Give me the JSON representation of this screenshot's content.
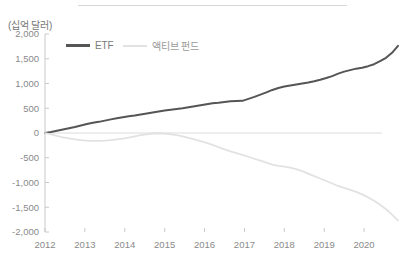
{
  "figure": {
    "unit_label": "(십억 달러)",
    "has_top_rule": true,
    "background": "#ffffff"
  },
  "legend": {
    "position": "top-left-inside",
    "items": [
      {
        "label": "ETF",
        "color": "#555555"
      },
      {
        "label": "액티브 펀드",
        "color": "#e2e2e2"
      }
    ]
  },
  "chart_data": {
    "type": "line",
    "title": "",
    "subtitle": "",
    "xlabel": "",
    "ylabel": "(십억 달러)",
    "unit": "십억 달러",
    "grid": false,
    "legend_position": "top-left",
    "xlim": [
      2012,
      2020.9
    ],
    "ylim": [
      -2000,
      2000
    ],
    "ytick_labels": [
      "2,000",
      "1,500",
      "1,000",
      "500",
      "0",
      "-500",
      "-1,000",
      "-1,500",
      "-2,000"
    ],
    "ytick_values": [
      2000,
      1500,
      1000,
      500,
      0,
      -500,
      -1000,
      -1500,
      -2000
    ],
    "xtick_labels": [
      "2012",
      "2013",
      "2014",
      "2015",
      "2016",
      "2017",
      "2018",
      "2019",
      "2020"
    ],
    "xtick_values": [
      2012,
      2013,
      2014,
      2015,
      2016,
      2017,
      2018,
      2019,
      2020
    ],
    "x": [
      2012.0,
      2012.15,
      2012.3,
      2012.45,
      2012.6,
      2012.75,
      2012.9,
      2013.05,
      2013.2,
      2013.35,
      2013.5,
      2013.65,
      2013.8,
      2013.95,
      2014.1,
      2014.25,
      2014.4,
      2014.55,
      2014.7,
      2014.85,
      2015.0,
      2015.15,
      2015.3,
      2015.45,
      2015.6,
      2015.75,
      2015.9,
      2016.05,
      2016.2,
      2016.35,
      2016.5,
      2016.65,
      2016.8,
      2016.95,
      2017.1,
      2017.25,
      2017.4,
      2017.55,
      2017.7,
      2017.85,
      2018.0,
      2018.15,
      2018.3,
      2018.45,
      2018.6,
      2018.75,
      2018.9,
      2019.05,
      2019.2,
      2019.35,
      2019.5,
      2019.65,
      2019.8,
      2019.95,
      2020.1,
      2020.25,
      2020.4,
      2020.55,
      2020.7,
      2020.85
    ],
    "series": [
      {
        "name": "ETF",
        "color": "#555555",
        "values": [
          0,
          20,
          45,
          70,
          95,
          120,
          150,
          180,
          205,
          225,
          250,
          275,
          300,
          320,
          340,
          355,
          375,
          395,
          415,
          435,
          455,
          470,
          485,
          500,
          520,
          540,
          560,
          580,
          600,
          610,
          625,
          640,
          645,
          650,
          690,
          730,
          775,
          820,
          870,
          910,
          940,
          960,
          980,
          1000,
          1020,
          1045,
          1075,
          1110,
          1150,
          1200,
          1240,
          1270,
          1300,
          1320,
          1350,
          1390,
          1450,
          1520,
          1620,
          1760
        ]
      },
      {
        "name": "액티브 펀드",
        "color": "#e2e2e2",
        "values": [
          0,
          -30,
          -60,
          -90,
          -110,
          -130,
          -145,
          -155,
          -160,
          -160,
          -155,
          -145,
          -130,
          -115,
          -95,
          -70,
          -45,
          -25,
          -10,
          -5,
          -10,
          -25,
          -45,
          -70,
          -100,
          -130,
          -165,
          -200,
          -240,
          -285,
          -330,
          -370,
          -405,
          -440,
          -480,
          -520,
          -560,
          -600,
          -640,
          -665,
          -680,
          -700,
          -730,
          -770,
          -820,
          -870,
          -920,
          -970,
          -1020,
          -1070,
          -1110,
          -1150,
          -1190,
          -1240,
          -1300,
          -1370,
          -1450,
          -1540,
          -1650,
          -1770
        ]
      }
    ]
  }
}
